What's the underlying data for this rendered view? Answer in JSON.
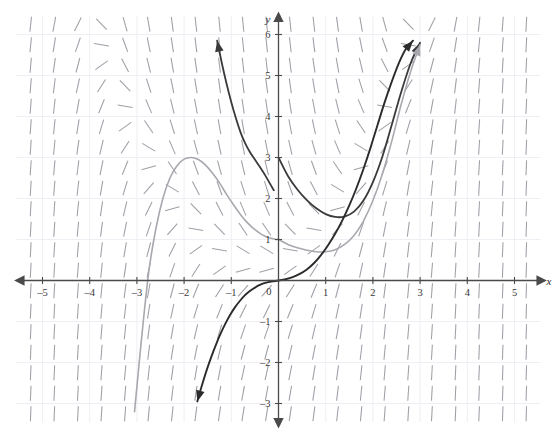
{
  "figure": {
    "kind": "slope-field-with-solution-curves",
    "background": "#ffffff",
    "grid_color": "#eeeef4",
    "axis_color": "#4a4a4a",
    "tick_label_color": "#3a3a3a",
    "slope_mark_color": "#9a9aa2",
    "x_axis_label": "x",
    "y_axis_label": "y",
    "top_partial_caption": ""
  },
  "chart_data": {
    "type": "line",
    "title": "",
    "subtitle": "",
    "xlabel": "x",
    "ylabel": "y",
    "xlim": [
      -5.55,
      5.55
    ],
    "ylim": [
      -3.45,
      6.45
    ],
    "grid": true,
    "legend_position": "none",
    "x_ticks": [
      -5,
      -4,
      -3,
      -2,
      -1,
      0,
      1,
      2,
      3,
      4,
      5
    ],
    "x_tick_labels": [
      "–5",
      "–4",
      "–3",
      "–2",
      "–1",
      "0",
      "1",
      "2",
      "3",
      "4",
      "5"
    ],
    "y_ticks": [
      -3,
      -2,
      -1,
      1,
      2,
      3,
      4,
      5,
      6
    ],
    "y_tick_labels": [
      "–3",
      "–2",
      "–1",
      "1",
      "2",
      "3",
      "4",
      "5",
      "6"
    ],
    "origin_label": "0",
    "axis_arrows": [
      "left",
      "right",
      "up",
      "down"
    ],
    "slope_field": {
      "description": "short line segments showing dy/dx at each lattice point",
      "x_range": [
        -5.25,
        5.25
      ],
      "y_range": [
        -3.25,
        6.25
      ],
      "x_step": 0.5,
      "y_step": 0.5,
      "slope_formula": "dy/dx = x^2 + x - 2*y + 1",
      "segment_length_px": 15,
      "color": "#9a9aa2"
    },
    "series": [
      {
        "name": "solution-curve-dark-1",
        "color": "#3a3a3a",
        "width": 1.8,
        "arrow_start": true,
        "arrow_end": true,
        "y_intercept": 3.0,
        "points": [
          [
            -1.3,
            5.85
          ],
          [
            -1.2,
            5.3
          ],
          [
            -1.1,
            4.8
          ],
          [
            -1.0,
            4.35
          ],
          [
            -0.9,
            3.95
          ],
          [
            -0.8,
            3.6
          ],
          [
            -0.7,
            3.33
          ],
          [
            -0.6,
            3.12
          ],
          [
            -0.5,
            2.95
          ],
          [
            -0.4,
            2.78
          ],
          [
            -0.3,
            2.6
          ],
          [
            -0.2,
            2.4
          ],
          [
            -0.1,
            2.2
          ],
          [
            0.0,
            3.0
          ],
          [
            0.2,
            2.55
          ],
          [
            0.4,
            2.22
          ],
          [
            0.6,
            1.96
          ],
          [
            0.8,
            1.76
          ],
          [
            1.0,
            1.62
          ],
          [
            1.2,
            1.55
          ],
          [
            1.4,
            1.56
          ],
          [
            1.6,
            1.68
          ],
          [
            1.8,
            1.95
          ],
          [
            2.0,
            2.4
          ],
          [
            2.2,
            3.02
          ],
          [
            2.4,
            3.8
          ],
          [
            2.6,
            4.6
          ],
          [
            2.8,
            5.3
          ],
          [
            3.0,
            5.8
          ]
        ]
      },
      {
        "name": "solution-curve-gray-1",
        "color": "#a8a8ae",
        "width": 1.6,
        "arrow_start": false,
        "arrow_end": true,
        "y_intercept": 1.0,
        "local_max": [
          -1.85,
          3.0
        ],
        "points": [
          [
            -3.05,
            -3.2
          ],
          [
            -2.9,
            -1.4
          ],
          [
            -2.75,
            0.2
          ],
          [
            -2.6,
            1.25
          ],
          [
            -2.45,
            2.0
          ],
          [
            -2.3,
            2.5
          ],
          [
            -2.15,
            2.8
          ],
          [
            -2.0,
            2.96
          ],
          [
            -1.85,
            3.0
          ],
          [
            -1.7,
            2.95
          ],
          [
            -1.55,
            2.82
          ],
          [
            -1.4,
            2.62
          ],
          [
            -1.25,
            2.38
          ],
          [
            -1.1,
            2.1
          ],
          [
            -0.95,
            1.84
          ],
          [
            -0.8,
            1.6
          ],
          [
            -0.65,
            1.4
          ],
          [
            -0.5,
            1.24
          ],
          [
            -0.35,
            1.12
          ],
          [
            -0.2,
            1.04
          ],
          [
            -0.05,
            1.0
          ],
          [
            0.0,
            1.0
          ],
          [
            0.2,
            0.88
          ],
          [
            0.4,
            0.8
          ],
          [
            0.6,
            0.74
          ],
          [
            0.8,
            0.7
          ],
          [
            1.0,
            0.7
          ],
          [
            1.2,
            0.75
          ],
          [
            1.4,
            0.88
          ],
          [
            1.6,
            1.1
          ],
          [
            1.8,
            1.45
          ],
          [
            2.0,
            1.95
          ],
          [
            2.2,
            2.6
          ],
          [
            2.4,
            3.4
          ],
          [
            2.6,
            4.3
          ],
          [
            2.8,
            5.1
          ],
          [
            3.0,
            5.75
          ]
        ]
      },
      {
        "name": "solution-curve-dark-2",
        "color": "#2b2b2b",
        "width": 1.9,
        "arrow_start": true,
        "arrow_end": true,
        "y_intercept": 0.0,
        "inflection": [
          0.0,
          0.0
        ],
        "points": [
          [
            -1.72,
            -2.95
          ],
          [
            -1.62,
            -2.55
          ],
          [
            -1.52,
            -2.18
          ],
          [
            -1.42,
            -1.85
          ],
          [
            -1.32,
            -1.55
          ],
          [
            -1.22,
            -1.28
          ],
          [
            -1.12,
            -1.04
          ],
          [
            -1.02,
            -0.83
          ],
          [
            -0.92,
            -0.65
          ],
          [
            -0.82,
            -0.5
          ],
          [
            -0.72,
            -0.37
          ],
          [
            -0.62,
            -0.27
          ],
          [
            -0.52,
            -0.19
          ],
          [
            -0.42,
            -0.12
          ],
          [
            -0.32,
            -0.07
          ],
          [
            -0.22,
            -0.04
          ],
          [
            -0.12,
            -0.02
          ],
          [
            0.0,
            0.0
          ],
          [
            0.15,
            0.03
          ],
          [
            0.3,
            0.08
          ],
          [
            0.45,
            0.16
          ],
          [
            0.6,
            0.27
          ],
          [
            0.75,
            0.42
          ],
          [
            0.9,
            0.62
          ],
          [
            1.05,
            0.86
          ],
          [
            1.2,
            1.14
          ],
          [
            1.35,
            1.46
          ],
          [
            1.5,
            1.83
          ],
          [
            1.65,
            2.25
          ],
          [
            1.8,
            2.72
          ],
          [
            1.95,
            3.24
          ],
          [
            2.1,
            3.8
          ],
          [
            2.25,
            4.35
          ],
          [
            2.4,
            4.85
          ],
          [
            2.55,
            5.3
          ],
          [
            2.7,
            5.65
          ],
          [
            2.85,
            5.85
          ]
        ]
      }
    ]
  }
}
